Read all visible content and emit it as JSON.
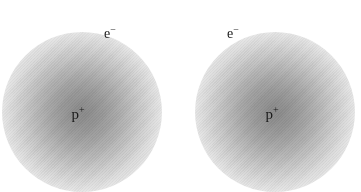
{
  "figure": {
    "type": "science-diagram",
    "background_color": "#ffffff",
    "width": 361,
    "height": 192
  },
  "atoms": [
    {
      "id": "left-atom",
      "electron_label": "e",
      "electron_charge": "−",
      "nucleus_label": "p",
      "nucleus_charge": "+",
      "cloud": {
        "center_x": 82,
        "center_y": 112,
        "radius": 80,
        "core_color": "#8c8c8c",
        "edge_color": "#ffffff"
      },
      "electron_label_x": 110,
      "electron_label_y": 33,
      "nucleus_label_x": 78,
      "nucleus_label_y": 113
    },
    {
      "id": "right-atom",
      "electron_label": "e",
      "electron_charge": "−",
      "nucleus_label": "p",
      "nucleus_charge": "+",
      "cloud": {
        "center_x": 275,
        "center_y": 112,
        "radius": 80,
        "core_color": "#8c8c8c",
        "edge_color": "#ffffff"
      },
      "electron_label_x": 233,
      "electron_label_y": 33,
      "nucleus_label_x": 272,
      "nucleus_label_y": 113
    }
  ]
}
